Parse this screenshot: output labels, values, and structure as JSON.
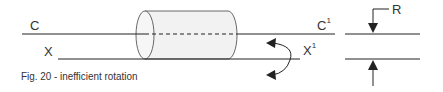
{
  "figure": {
    "caption": "Fig. 20 - inefficient rotation",
    "labels": {
      "c_left": "C",
      "x_left": "X",
      "c_right": "C",
      "c_right_sup": "1",
      "x_right": "X",
      "x_right_sup": "1",
      "r": "R"
    },
    "colors": {
      "line": "#222222",
      "cylinder_fill": "#f2f2f2",
      "text": "#333333"
    }
  }
}
